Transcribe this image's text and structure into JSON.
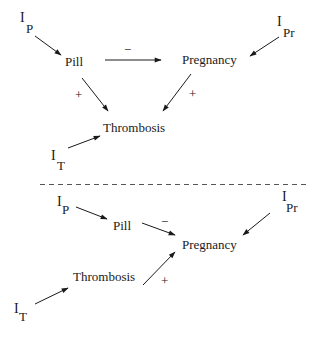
{
  "diagram": {
    "top": {
      "nodes": {
        "pill": "Pill",
        "pregnancy": "Pregnancy",
        "thrombosis": "Thrombosis",
        "i_p": {
          "base": "I",
          "sub": "P"
        },
        "i_pr": {
          "base": "I",
          "sub": "Pr"
        },
        "i_t": {
          "base": "I",
          "sub": "T"
        }
      },
      "edges": [
        {
          "from": "I_P",
          "to": "Pill",
          "sign": ""
        },
        {
          "from": "Pill",
          "to": "Pregnancy",
          "sign": "−"
        },
        {
          "from": "I_Pr",
          "to": "Pregnancy",
          "sign": ""
        },
        {
          "from": "Pill",
          "to": "Thrombosis",
          "sign": "+"
        },
        {
          "from": "Pregnancy",
          "to": "Thrombosis",
          "sign": "+"
        },
        {
          "from": "I_T",
          "to": "Thrombosis",
          "sign": ""
        }
      ],
      "signs": {
        "pill_pregnancy": "−",
        "pill_thrombosis": "+",
        "pregnancy_thrombosis": "+"
      }
    },
    "bottom": {
      "nodes": {
        "pill": "Pill",
        "pregnancy": "Pregnancy",
        "thrombosis": "Thrombosis",
        "i_p": {
          "base": "I",
          "sub": "P"
        },
        "i_pr": {
          "base": "I",
          "sub": "Pr"
        },
        "i_t": {
          "base": "I",
          "sub": "T"
        }
      },
      "edges": [
        {
          "from": "I_P",
          "to": "Pill",
          "sign": ""
        },
        {
          "from": "Pill",
          "to": "Pregnancy",
          "sign": "−"
        },
        {
          "from": "I_Pr",
          "to": "Pregnancy",
          "sign": ""
        },
        {
          "from": "I_T",
          "to": "Thrombosis",
          "sign": ""
        },
        {
          "from": "Thrombosis",
          "to": "Pregnancy",
          "sign": "+"
        }
      ],
      "signs": {
        "pill_pregnancy": "−",
        "thrombosis_pregnancy": "+"
      }
    },
    "separator": "dashed"
  }
}
